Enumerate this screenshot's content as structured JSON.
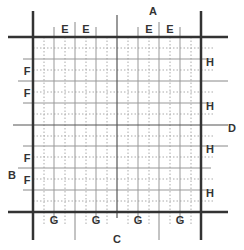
{
  "diagram": {
    "type": "grid-layout-diagram",
    "colors": {
      "thick_line": "#333333",
      "solid_grid": "#999999",
      "dotted_grid": "#aaaaaa",
      "label": "#333333",
      "background": "#ffffff"
    },
    "labels": {
      "A": "A",
      "B": "B",
      "C": "C",
      "D": "D",
      "E": "E",
      "F": "F",
      "G": "G",
      "H": "H"
    },
    "top_labels": [
      "E",
      "E",
      "E",
      "E"
    ],
    "left_labels": [
      "F",
      "F",
      "F",
      "F"
    ],
    "right_labels": [
      "H",
      "H",
      "H",
      "H"
    ],
    "bottom_labels": [
      "G",
      "G",
      "G",
      "G"
    ],
    "grid": {
      "border": {
        "left": 33,
        "top": 37,
        "right": 201,
        "bottom": 212
      },
      "solid_x": [
        54,
        75,
        96,
        117,
        138,
        159,
        180
      ],
      "solid_y": [
        59,
        81,
        103,
        125,
        146,
        168,
        190
      ],
      "center_x": 117,
      "center_y": 125
    }
  }
}
